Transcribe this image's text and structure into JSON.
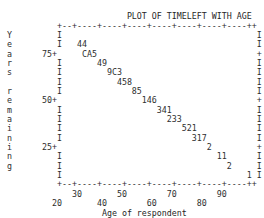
{
  "figure": {
    "title": "PLOT OF TIMELEFT WITH AGE",
    "xlabel": "Age of respondent",
    "ylabel": "Years remaining",
    "ylabel_chars": [
      "Y",
      "e",
      "a",
      "r",
      "s",
      "",
      "r",
      "e",
      "m",
      "a",
      "i",
      "n",
      "i",
      "n",
      "g"
    ],
    "axis_char_vertical": "I",
    "axis_char_tick": "+",
    "axis_char_horizontal": "-",
    "y_tick_labels": [
      "75+",
      "50+",
      "25+"
    ],
    "x_tick_labels_upper": [
      "30",
      "50",
      "70",
      "90"
    ],
    "x_tick_labels_lower": [
      "20",
      "40",
      "60",
      "80"
    ],
    "colors": {
      "ink": "#2e2e2e",
      "background": "#ffffff"
    }
  },
  "chart_data": {
    "type": "scatter",
    "title": "PLOT OF TIMELEFT WITH AGE",
    "xlabel": "Age of respondent",
    "ylabel": "Years remaining",
    "xlim": [
      15,
      92
    ],
    "ylim": [
      0,
      87
    ],
    "grid": false,
    "legend": null,
    "x_ticks": [
      20,
      30,
      40,
      50,
      60,
      70,
      80,
      90
    ],
    "y_ticks": [
      25,
      50,
      75
    ],
    "marker_codes": [
      {
        "row": 2,
        "x_approx": 22,
        "y_approx": 80,
        "text": "44"
      },
      {
        "row": 3,
        "x_approx": 27,
        "y_approx": 75,
        "text": "CA5"
      },
      {
        "row": 4,
        "x_approx": 33,
        "y_approx": 71,
        "text": "49"
      },
      {
        "row": 5,
        "x_approx": 37,
        "y_approx": 66,
        "text": "9C3"
      },
      {
        "row": 6,
        "x_approx": 41,
        "y_approx": 62,
        "text": "458"
      },
      {
        "row": 7,
        "x_approx": 46,
        "y_approx": 57,
        "text": "85"
      },
      {
        "row": 8,
        "x_approx": 51,
        "y_approx": 53,
        "text": "146"
      },
      {
        "row": 9,
        "x_approx": 57,
        "y_approx": 48,
        "text": "341"
      },
      {
        "row": 10,
        "x_approx": 61,
        "y_approx": 44,
        "text": "233"
      },
      {
        "row": 11,
        "x_approx": 66,
        "y_approx": 39,
        "text": "521"
      },
      {
        "row": 12,
        "x_approx": 70,
        "y_approx": 35,
        "text": "317"
      },
      {
        "row": 13,
        "x_approx": 75,
        "y_approx": 30,
        "text": "2"
      },
      {
        "row": 14,
        "x_approx": 80,
        "y_approx": 26,
        "text": "11"
      },
      {
        "row": 15,
        "x_approx": 84,
        "y_approx": 21,
        "text": "2"
      },
      {
        "row": 16,
        "x_approx": 89,
        "y_approx": 17,
        "text": "1"
      }
    ],
    "series": [
      {
        "name": "TIMELEFT vs AGE",
        "x": [
          22,
          27,
          33,
          37,
          41,
          46,
          51,
          57,
          61,
          66,
          70,
          75,
          80,
          84,
          89
        ],
        "y": [
          80,
          75,
          71,
          66,
          62,
          57,
          53,
          48,
          44,
          39,
          35,
          30,
          26,
          21,
          17
        ]
      }
    ]
  },
  "grid_rows": [
    {
      "name": "title",
      "text": "                         PLOT OF TIMELEFT WITH AGE"
    },
    {
      "name": "top-rule",
      "text": "           +--+----+----+----+----+----+----+----++"
    },
    {
      "name": "row-1",
      "text": " Y         I                                       I"
    },
    {
      "name": "row-2",
      "text": " e         I   44                                  I"
    },
    {
      "name": "row-3",
      "text": " a      75+     CA5                                +"
    },
    {
      "name": "row-4",
      "text": " r         I       49                              I"
    },
    {
      "name": "row-5",
      "text": " s         I         9C3                           I"
    },
    {
      "name": "row-6",
      "text": "           I           458                         I"
    },
    {
      "name": "row-7",
      "text": " r         I              85                       I"
    },
    {
      "name": "row-8",
      "text": " e      50+                 146                    +"
    },
    {
      "name": "row-9",
      "text": " m         I                   341                 I"
    },
    {
      "name": "row-10",
      "text": " a         I                     233               I"
    },
    {
      "name": "row-11",
      "text": " i         I                        521            I"
    },
    {
      "name": "row-12",
      "text": " n         I                          317          I"
    },
    {
      "name": "row-13",
      "text": " i      25+                              2         +"
    },
    {
      "name": "row-14",
      "text": " n         I                               11      I"
    },
    {
      "name": "row-15",
      "text": " g         I                                 2     I"
    },
    {
      "name": "row-16",
      "text": "           I                                     1 I"
    },
    {
      "name": "bottom-rule",
      "text": "           +--+----+----+----+----+----+----+----++"
    },
    {
      "name": "xticks-upper",
      "text": "              30       50        70        90"
    },
    {
      "name": "xticks-lower",
      "text": "          20       40        60        80"
    },
    {
      "name": "xlabel-row",
      "text": "                    Age of respondent"
    }
  ]
}
